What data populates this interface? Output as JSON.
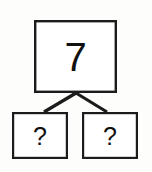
{
  "diagram": {
    "type": "number-bond",
    "title": "",
    "background_color": "#fdfdfc",
    "line_color": "#1b1b1b",
    "box_fill_color": "#ffffff",
    "whole": {
      "label": "7",
      "box": {
        "x": 34,
        "y": 20,
        "width": 83,
        "height": 73,
        "stroke_width": 2.4
      }
    },
    "parts": [
      {
        "label": "?",
        "box": {
          "x": 12,
          "y": 112,
          "width": 56,
          "height": 47,
          "stroke_width": 2.2
        }
      },
      {
        "label": "?",
        "box": {
          "x": 82,
          "y": 112,
          "width": 56,
          "height": 47,
          "stroke_width": 2.2
        }
      }
    ],
    "connectors": [
      {
        "name": "left",
        "x1": 76,
        "y1": 93,
        "x2": 44,
        "y2": 112,
        "stroke_width": 3.2
      },
      {
        "name": "right",
        "x1": 76,
        "y1": 93,
        "x2": 107,
        "y2": 112,
        "stroke_width": 3.2
      }
    ]
  }
}
